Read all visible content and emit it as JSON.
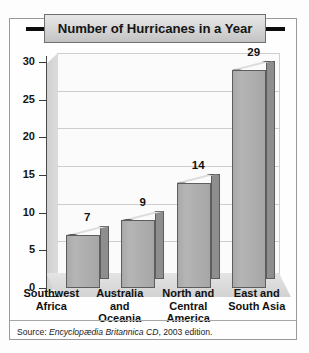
{
  "chart_data": {
    "type": "bar",
    "title": "Number of Hurricanes in a Year",
    "categories": [
      "Southwest Africa",
      "Australia and Oceania",
      "North and Central America",
      "East and South Asia"
    ],
    "category_lines": [
      [
        "Southwest",
        "Africa"
      ],
      [
        "Australia",
        "and",
        "Oceania"
      ],
      [
        "North and",
        "Central",
        "America"
      ],
      [
        "East and",
        "South Asia"
      ]
    ],
    "values": [
      7,
      9,
      14,
      29
    ],
    "xlabel": "",
    "ylabel": "",
    "ylim": [
      0,
      30
    ],
    "yticks": [
      0,
      5,
      10,
      15,
      20,
      25,
      30
    ],
    "ytick_labels": [
      "0",
      "5",
      "10",
      "15",
      "20",
      "25",
      "30"
    ],
    "grid": true,
    "legend": false,
    "bar_style": "3d",
    "colors": {
      "bar_front": "#ADADAD",
      "bar_top": "#DCDCDC",
      "bar_side": "#8E8E8E",
      "bar_outline": "#5D5D5D",
      "plot_background": "#FBFBFB",
      "gridline": "#CFCFCF",
      "floor": "#DBDBDB",
      "side_wall": "#D6D6D6",
      "title_banner": "#D4D4D4",
      "title_rail": "#0D0D0D",
      "text": "#111111"
    }
  },
  "source": {
    "prefix": "Source: ",
    "italic": "Encyclopædia Britannica CD",
    "suffix": ", 2003 edition."
  }
}
